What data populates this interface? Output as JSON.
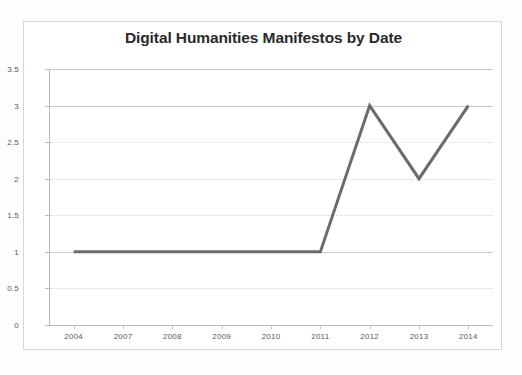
{
  "chart_data": {
    "type": "line",
    "title": "Digital Humanities Manifestos by Date",
    "xlabel": "",
    "ylabel": "",
    "categories": [
      "2004",
      "2007",
      "2008",
      "2009",
      "2010",
      "2011",
      "2012",
      "2013",
      "2014"
    ],
    "values": [
      1,
      1,
      1,
      1,
      1,
      1,
      3,
      2,
      3
    ],
    "series": [
      {
        "name": "Manifestos",
        "values": [
          1,
          1,
          1,
          1,
          1,
          1,
          3,
          2,
          3
        ]
      }
    ],
    "ylim": [
      0,
      3.5
    ],
    "y_ticks": [
      "3.5",
      "3",
      "2.5",
      "2",
      "1.5",
      "1",
      "0.5",
      "0"
    ],
    "y_tick_values": [
      3.5,
      3,
      2.5,
      2,
      1.5,
      1,
      0.5,
      0
    ],
    "grid": true,
    "legend": false,
    "legend_position": "none",
    "line_color": "#6b6b6b",
    "grid_color": "#d9d9d9",
    "axis_color": "#b9b9b9",
    "plot_background": "#ffffff",
    "title_color": "#2a2a2a",
    "tick_label_color": "#595959"
  }
}
